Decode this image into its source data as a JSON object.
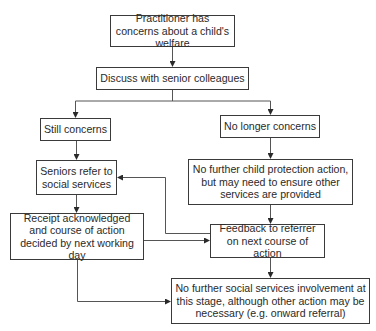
{
  "diagram": {
    "type": "flowchart",
    "nodes": {
      "start": "Practitioner has concerns about a child's welfare",
      "discuss": "Discuss with senior colleagues",
      "still_concerns": "Still concerns",
      "no_longer_concerns": "No longer concerns",
      "seniors_refer": "Seniors refer to social services",
      "no_further_cp": "No further child protection action, but may need to ensure other services are provided",
      "receipt": "Receipt acknowledged and course of action decided by next working day",
      "feedback": "Feedback to referrer on next course of action",
      "no_further_ss": "No further social services involvement at this stage, although other action may be necessary (e.g. onward referral)"
    },
    "edges": [
      {
        "from": "start",
        "to": "discuss"
      },
      {
        "from": "discuss",
        "to": "still_concerns"
      },
      {
        "from": "discuss",
        "to": "no_longer_concerns"
      },
      {
        "from": "still_concerns",
        "to": "seniors_refer"
      },
      {
        "from": "no_longer_concerns",
        "to": "no_further_cp"
      },
      {
        "from": "seniors_refer",
        "to": "receipt"
      },
      {
        "from": "no_further_cp",
        "to": "feedback"
      },
      {
        "from": "receipt",
        "to": "feedback"
      },
      {
        "from": "feedback",
        "to": "seniors_refer"
      },
      {
        "from": "feedback",
        "to": "no_further_ss"
      },
      {
        "from": "receipt",
        "to": "no_further_ss"
      }
    ],
    "colors": {
      "line": "#3a3a3a",
      "box_border": "#3a3a3a",
      "background": "#ffffff"
    }
  }
}
